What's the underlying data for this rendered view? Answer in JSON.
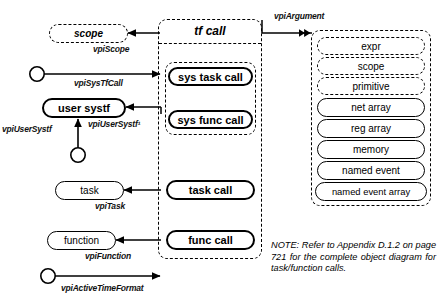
{
  "diagram": {
    "left_column": {
      "scope_node": "scope",
      "user_systf_node": "user systf",
      "task_node": "task",
      "function_node": "function"
    },
    "center_container": {
      "header": "tf call",
      "inner_group_items": [
        "sys task call",
        "sys func call"
      ],
      "items": [
        "task call",
        "func call"
      ]
    },
    "right_container": {
      "dashed_items": [
        "expr",
        "scope",
        "primitive"
      ],
      "solid_items": [
        "net array",
        "reg array",
        "memory",
        "named event",
        "named event array"
      ]
    },
    "relations": [
      {
        "name": "vpiScope",
        "label": "vpiScope"
      },
      {
        "name": "vpiArgument",
        "label": "vpiArgument"
      },
      {
        "name": "vpiSysTfCall",
        "label": "vpiSysTfCall"
      },
      {
        "name": "vpiUserSystf-left",
        "label": "vpiUserSystf"
      },
      {
        "name": "vpiUserSystf-right",
        "label": "vpiUserSystf¹"
      },
      {
        "name": "vpiTask",
        "label": "vpiTask"
      },
      {
        "name": "vpiFunction",
        "label": "vpiFunction"
      },
      {
        "name": "vpiActiveTimeFormat",
        "label": "vpiActiveTimeFormat"
      }
    ],
    "note": "NOTE: Refer to Appendix D.1.2 on page 721 for the complete object diagram for task/function calls.",
    "colors": {
      "ink": "#000000",
      "background": "#ffffff"
    }
  }
}
